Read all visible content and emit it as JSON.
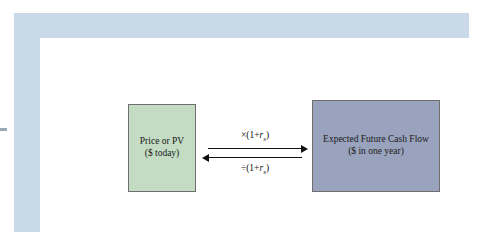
{
  "diagram": {
    "title": "",
    "left_box": {
      "line1": "Price or PV",
      "line2": "($ today)",
      "color": "#c3dcc3"
    },
    "right_box": {
      "line1": "Expected Future Cash Flow",
      "line2": "($ in one year)",
      "color": "#9aa3bd"
    },
    "arrows": {
      "top_label_prefix": "×(1+",
      "top_label_var": "r",
      "top_label_sub": "s",
      "top_label_suffix": ")",
      "bottom_label_prefix": "÷(1+",
      "bottom_label_var": "r",
      "bottom_label_sub": "s",
      "bottom_label_suffix": ")",
      "top_direction": "right",
      "bottom_direction": "left"
    },
    "frame_color": "#c9d9e8",
    "plate_color": "#ffffff"
  }
}
